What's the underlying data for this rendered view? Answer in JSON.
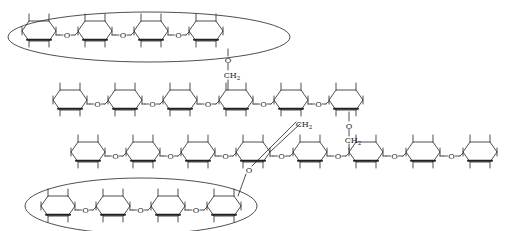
{
  "diagram": {
    "title": "",
    "colors": {
      "stroke": "#222222",
      "background": "#ffffff",
      "bold_edge": "#111111"
    },
    "linker_label": "O",
    "branch_label": "CH",
    "branch_sub": "2",
    "chains": [
      {
        "id": "chain-1-circled-top",
        "y": 31,
        "ring_x": [
          39,
          95,
          151,
          206
        ],
        "circled": true
      },
      {
        "id": "chain-2",
        "y": 100,
        "ring_x": [
          70,
          125,
          180,
          236,
          291,
          346
        ],
        "circled": false
      },
      {
        "id": "chain-3",
        "y": 152,
        "ring_x": [
          88,
          143,
          198,
          253,
          310,
          366,
          423,
          480
        ],
        "circled": false
      },
      {
        "id": "chain-4-circled-bottom",
        "y": 206,
        "ring_x": [
          58,
          113,
          168,
          224
        ],
        "circled": true
      }
    ],
    "ellipses": [
      {
        "id": "ellipse-top",
        "cx": 149,
        "cy": 37,
        "rx": 141,
        "ry": 25
      },
      {
        "id": "ellipse-bottom",
        "cx": 141,
        "cy": 206,
        "rx": 116,
        "ry": 28
      }
    ],
    "branches": [
      {
        "id": "branch-chain1-to-chain2",
        "o": [
          228,
          60
        ],
        "ch2": [
          232,
          75
        ]
      },
      {
        "id": "branch-chain2-to-chain3",
        "o": [
          349,
          126
        ],
        "ch2": [
          353,
          140
        ]
      },
      {
        "id": "branch-chain4-to-chain3",
        "o": [
          249,
          170
        ],
        "ch2": [
          304,
          124
        ]
      }
    ]
  }
}
